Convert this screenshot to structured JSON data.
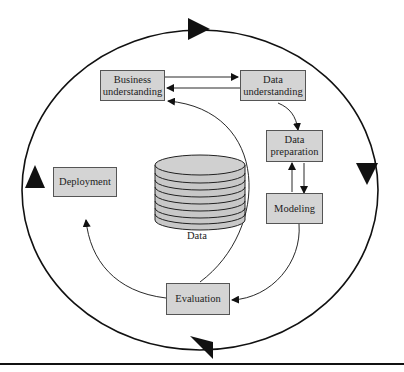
{
  "diagram": {
    "center": {
      "label": "Data",
      "icon": "database-cylinder-icon"
    },
    "phases": [
      {
        "id": "business",
        "label_line1": "Business",
        "label_line2": "understanding"
      },
      {
        "id": "data_understanding",
        "label_line1": "Data",
        "label_line2": "understanding"
      },
      {
        "id": "data_preparation",
        "label_line1": "Data",
        "label_line2": "preparation"
      },
      {
        "id": "modeling",
        "label": "Modeling"
      },
      {
        "id": "evaluation",
        "label": "Evaluation"
      },
      {
        "id": "deployment",
        "label": "Deployment"
      }
    ],
    "edges": [
      {
        "from": "Business understanding",
        "to": "Data understanding"
      },
      {
        "from": "Data understanding",
        "to": "Business understanding"
      },
      {
        "from": "Data understanding",
        "to": "Data preparation"
      },
      {
        "from": "Data preparation",
        "to": "Modeling"
      },
      {
        "from": "Modeling",
        "to": "Data preparation"
      },
      {
        "from": "Modeling",
        "to": "Evaluation"
      },
      {
        "from": "Evaluation",
        "to": "Business understanding"
      },
      {
        "from": "Evaluation",
        "to": "Deployment"
      }
    ],
    "outer_cycle": "clockwise",
    "colors": {
      "box_fill": "#d4d4d4",
      "stroke": "#111111"
    }
  }
}
